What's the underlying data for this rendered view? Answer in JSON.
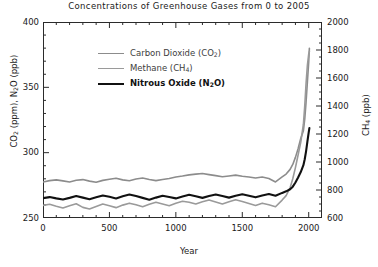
{
  "chart_data": {
    "type": "line",
    "title": "Concentrations of Greenhouse Gases from 0 to 2005",
    "xlabel": "Year",
    "ylabel": "CO₂ (ppm), N₂O (ppb)",
    "ylabel_right": "CH₄ (ppb)",
    "xlim": [
      0,
      2100
    ],
    "ylim": [
      250,
      400
    ],
    "ylim_right": [
      600,
      2000
    ],
    "xticks": [
      0,
      500,
      1000,
      1500,
      2000
    ],
    "yticks": [
      250,
      300,
      350,
      400
    ],
    "yticks_right": [
      600,
      800,
      1000,
      1200,
      1400,
      1600,
      1800,
      2000
    ],
    "grid": false,
    "legend_position": "upper-left-inside",
    "series": [
      {
        "name": "Carbon Dioxide (CO₂)",
        "label_html": "Carbon Dioxide (CO<sub>2</sub>)",
        "units": "ppm",
        "axis": "left",
        "color": "#8c8c8c",
        "width": 1.6,
        "x": [
          0,
          50,
          100,
          150,
          200,
          250,
          300,
          350,
          400,
          450,
          500,
          550,
          600,
          650,
          700,
          750,
          800,
          850,
          900,
          950,
          1000,
          1050,
          1100,
          1150,
          1200,
          1250,
          1300,
          1350,
          1400,
          1450,
          1500,
          1550,
          1600,
          1650,
          1700,
          1750,
          1800,
          1830,
          1860,
          1880,
          1900,
          1920,
          1940,
          1960,
          1970,
          1980,
          1990,
          2000,
          2005
        ],
        "y": [
          277.5,
          278.6,
          279.2,
          278.4,
          277.6,
          278.9,
          279.4,
          278.2,
          277.4,
          278.8,
          279.6,
          280.4,
          279.2,
          278.5,
          279.8,
          280.6,
          279.4,
          278.6,
          279.4,
          280.2,
          281.4,
          282.1,
          283.0,
          283.6,
          284.0,
          283.2,
          282.4,
          281.6,
          282.2,
          282.8,
          282.0,
          281.4,
          280.6,
          281.4,
          280.2,
          277.6,
          281.4,
          283.6,
          287.2,
          291.0,
          296.4,
          303.0,
          310.8,
          316.8,
          325.6,
          338.7,
          354.2,
          369.5,
          379.8
        ]
      },
      {
        "name": "Methane (CH₄)",
        "label_html": "Methane (CH<sub>4</sub>)",
        "units": "ppb",
        "axis": "right",
        "color": "#9a9a9a",
        "width": 1.6,
        "x": [
          0,
          50,
          100,
          150,
          200,
          250,
          300,
          350,
          400,
          450,
          500,
          550,
          600,
          650,
          700,
          750,
          800,
          850,
          900,
          950,
          1000,
          1050,
          1100,
          1150,
          1200,
          1250,
          1300,
          1350,
          1400,
          1450,
          1500,
          1550,
          1600,
          1650,
          1700,
          1750,
          1800,
          1830,
          1860,
          1880,
          1900,
          1920,
          1940,
          1960,
          1970,
          1980,
          1990,
          2000,
          2005
        ],
        "y": [
          690,
          698,
          684,
          672,
          688,
          702,
          676,
          664,
          682,
          700,
          688,
          674,
          692,
          706,
          694,
          680,
          698,
          712,
          700,
          688,
          706,
          720,
          712,
          700,
          716,
          728,
          714,
          700,
          716,
          730,
          718,
          704,
          690,
          706,
          694,
          680,
          728,
          760,
          816,
          880,
          960,
          1050,
          1140,
          1270,
          1400,
          1560,
          1690,
          1770,
          1790
        ]
      },
      {
        "name": "Nitrous Oxide (N₂O)",
        "label_html": "Nitrous Oxide (N<sub>2</sub>O)",
        "units": "ppb",
        "axis": "left",
        "color": "#111111",
        "width": 2.1,
        "x": [
          0,
          50,
          100,
          150,
          200,
          250,
          300,
          350,
          400,
          450,
          500,
          550,
          600,
          650,
          700,
          750,
          800,
          850,
          900,
          950,
          1000,
          1050,
          1100,
          1150,
          1200,
          1250,
          1300,
          1350,
          1400,
          1450,
          1500,
          1550,
          1600,
          1650,
          1700,
          1750,
          1800,
          1830,
          1860,
          1880,
          1900,
          1920,
          1940,
          1960,
          1970,
          1980,
          1990,
          2000,
          2005
        ],
        "y": [
          265.2,
          266.0,
          265.0,
          264.2,
          265.4,
          266.8,
          265.6,
          264.4,
          265.8,
          267.2,
          266.2,
          265.0,
          266.6,
          268.0,
          266.8,
          265.4,
          264.0,
          265.6,
          267.0,
          266.0,
          265.0,
          266.4,
          267.8,
          266.6,
          265.4,
          266.8,
          268.0,
          266.8,
          265.6,
          267.0,
          268.2,
          267.0,
          265.8,
          267.2,
          268.4,
          267.0,
          269.2,
          270.4,
          272.0,
          274.0,
          277.2,
          281.0,
          285.2,
          290.4,
          295.0,
          301.0,
          308.4,
          315.6,
          318.8
        ]
      }
    ]
  }
}
